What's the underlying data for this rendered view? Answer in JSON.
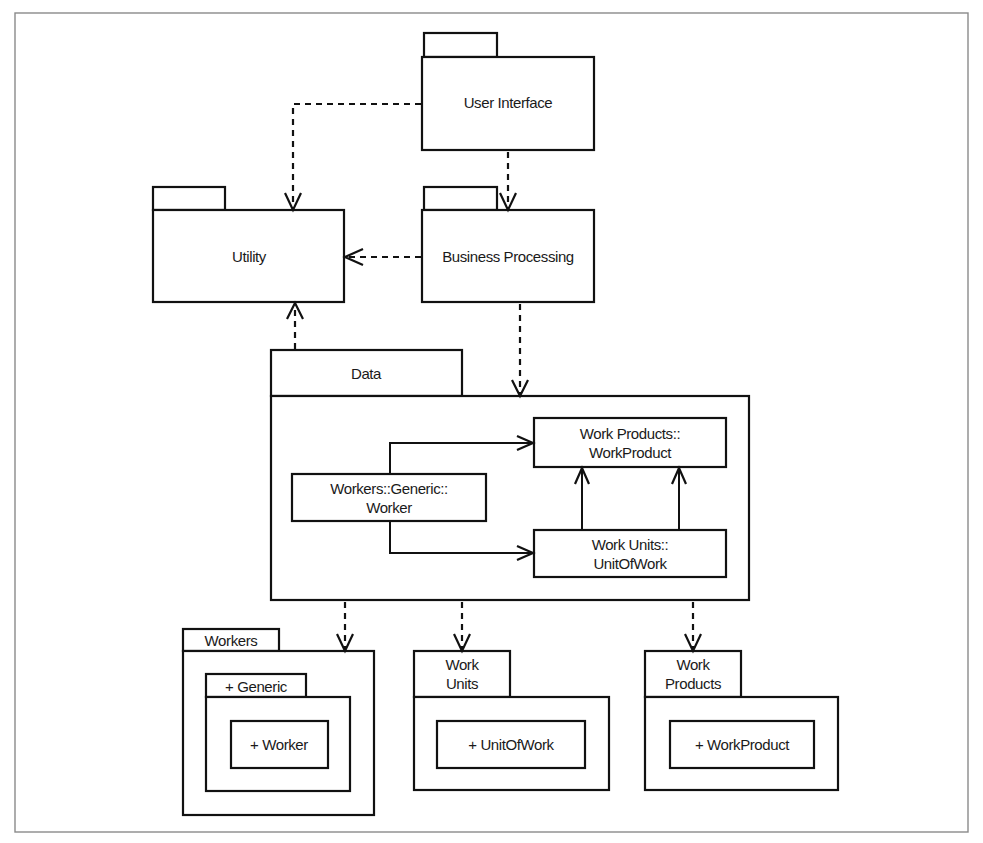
{
  "diagram": {
    "type": "UML package diagram",
    "packages": {
      "user_interface": {
        "label": "User Interface"
      },
      "utility": {
        "label": "Utility"
      },
      "business_processing": {
        "label": "Business Processing"
      },
      "data": {
        "label": "Data",
        "classes": {
          "work_product": {
            "line1": "Work Products::",
            "line2": "WorkProduct"
          },
          "worker": {
            "line1": "Workers::Generic::",
            "line2": "Worker"
          },
          "unit_of_work": {
            "line1": "Work Units::",
            "line2": "UnitOfWork"
          }
        }
      },
      "workers": {
        "label": "Workers",
        "subpackage": {
          "label": "+ Generic",
          "class_label": "+ Worker"
        }
      },
      "work_units": {
        "label_line1": "Work",
        "label_line2": "Units",
        "class_label": "+ UnitOfWork"
      },
      "work_products": {
        "label_line1": "Work",
        "label_line2": "Products",
        "class_label": "+ WorkProduct"
      }
    },
    "dependencies": [
      {
        "from": "User Interface",
        "to": "Utility",
        "style": "dashed-open-arrow"
      },
      {
        "from": "User Interface",
        "to": "Business Processing",
        "style": "dashed-open-arrow"
      },
      {
        "from": "Business Processing",
        "to": "Utility",
        "style": "dashed-open-arrow"
      },
      {
        "from": "Business Processing",
        "to": "Data",
        "style": "dashed-open-arrow"
      },
      {
        "from": "Data",
        "to": "Utility",
        "style": "dashed-open-arrow"
      },
      {
        "from": "Data",
        "to": "Workers",
        "style": "dashed-open-arrow"
      },
      {
        "from": "Data",
        "to": "Work Units",
        "style": "dashed-open-arrow"
      },
      {
        "from": "Data",
        "to": "Work Products",
        "style": "dashed-open-arrow"
      }
    ],
    "associations": [
      {
        "from": "Workers::Generic::Worker",
        "to": "Work Products::WorkProduct",
        "style": "solid-open-arrow"
      },
      {
        "from": "Workers::Generic::Worker",
        "to": "Work Units::UnitOfWork",
        "style": "solid-open-arrow"
      },
      {
        "from": "Work Units::UnitOfWork",
        "to": "Work Products::WorkProduct",
        "style": "solid-open-arrow",
        "count": 2
      }
    ],
    "colors": {
      "line": "#111111",
      "frame": "#8a8a8a",
      "background": "#ffffff"
    }
  }
}
